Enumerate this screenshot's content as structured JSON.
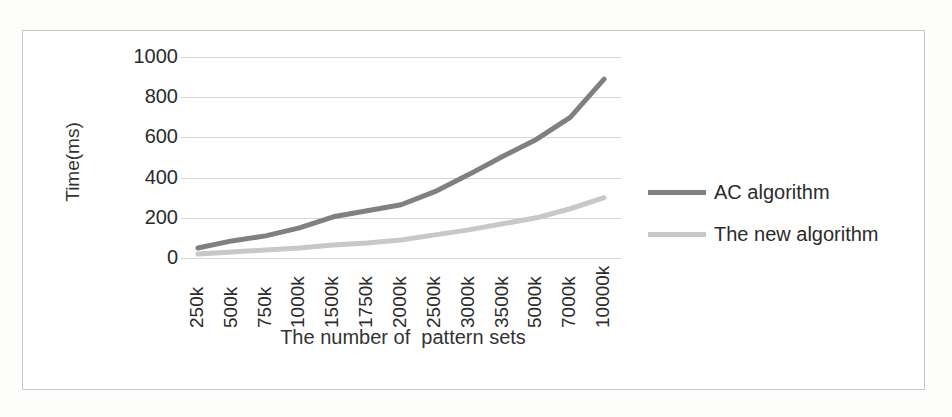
{
  "chart_data": {
    "type": "line",
    "title": "",
    "xlabel": "The number of  pattern sets",
    "ylabel": "Time(ms)",
    "categories": [
      "250k",
      "500k",
      "750k",
      "1000k",
      "1500k",
      "1750k",
      "2000k",
      "2500k",
      "3000k",
      "3500k",
      "5000k",
      "7000k",
      "10000k"
    ],
    "ylim": [
      0,
      1000
    ],
    "yticks": [
      1000,
      800,
      600,
      400,
      200,
      0
    ],
    "grid": true,
    "legend_position": "right",
    "series": [
      {
        "name": "AC algorithm",
        "color": "#808080",
        "values": [
          50,
          85,
          110,
          150,
          205,
          235,
          265,
          330,
          415,
          505,
          590,
          700,
          890
        ]
      },
      {
        "name": "The new algorithm",
        "color": "#c8c8c8",
        "values": [
          20,
          30,
          40,
          50,
          65,
          75,
          90,
          115,
          140,
          170,
          200,
          245,
          300
        ]
      }
    ]
  }
}
